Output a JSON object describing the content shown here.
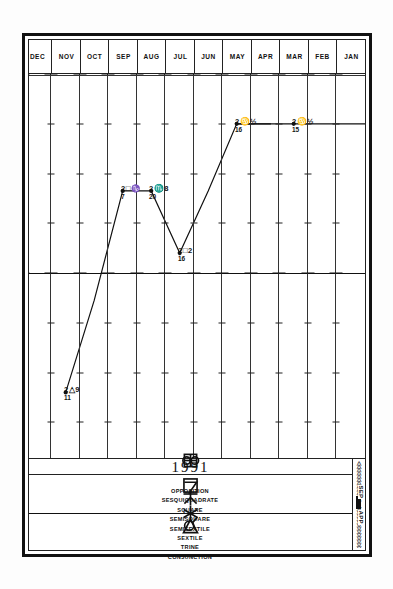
{
  "chart_data": {
    "type": "line",
    "title": "1991",
    "xlabel": "",
    "ylabel": "",
    "grid": true,
    "legend_position": "bottom",
    "orientation": "rotated-90",
    "categories": [
      "JAN",
      "FEB",
      "MAR",
      "APR",
      "MAY",
      "JUN",
      "JUL",
      "AUG",
      "SEP",
      "OCT",
      "NOV",
      "DEC"
    ],
    "axis_columns": [
      {
        "label": "OPPOSITION",
        "glyph": "opposition"
      },
      {
        "label": "SESQUIQUADRATE",
        "glyph": "sesquiquadrate"
      },
      {
        "label": "SQUARE",
        "glyph": "square"
      },
      {
        "label": "SEMISQUARE",
        "glyph": "semisquare"
      },
      {
        "label": "SEMISEXTILE",
        "glyph": "semisextile"
      },
      {
        "label": "SEXTILE",
        "glyph": "sextile"
      },
      {
        "label": "TRINE",
        "glyph": "trine"
      },
      {
        "label": "CONJUNCTION",
        "glyph": "conjunction"
      }
    ],
    "points": [
      {
        "month": "MAR",
        "label_deg": "2",
        "label_sign": "♋",
        "label_min": "½",
        "label_day": "15"
      },
      {
        "month": "MAY",
        "label_deg": "2",
        "label_sign": "♋",
        "label_min": "½",
        "label_day": "16"
      },
      {
        "month": "JUL",
        "label_deg": "2",
        "label_sign": "□",
        "label_min": "2",
        "label_day": "16"
      },
      {
        "month": "AUG",
        "label_deg": "2",
        "label_sign": "♏",
        "label_min": "8",
        "label_day": "20"
      },
      {
        "month": "SEP",
        "label_deg": "2",
        "label_sign": "□",
        "label_min": "♑",
        "label_day": "7"
      },
      {
        "month": "NOV",
        "label_deg": "2",
        "label_sign": "△",
        "label_min": "9",
        "label_day": "11"
      }
    ],
    "series": [
      {
        "name": "transit-aspect-track",
        "values": [
          1.0,
          1.0,
          1.0,
          1.0,
          1.0,
          2.35,
          3.6,
          2.35,
          2.35,
          4.55,
          6.4,
          6.4
        ]
      }
    ]
  },
  "header": {
    "year": "1991"
  },
  "scale": {
    "separating_label": "SEP",
    "applying_label": "APP"
  },
  "months": [
    {
      "label": "JAN"
    },
    {
      "label": "FEB"
    },
    {
      "label": "MAR"
    },
    {
      "label": "APR"
    },
    {
      "label": "MAY"
    },
    {
      "label": "JUN"
    },
    {
      "label": "JUL"
    },
    {
      "label": "AUG"
    },
    {
      "label": "SEP"
    },
    {
      "label": "OCT"
    },
    {
      "label": "NOV"
    },
    {
      "label": "DEC"
    }
  ],
  "aspects": [
    {
      "name": "OPPOSITION",
      "glyph": "opposition-glyph"
    },
    {
      "name": "SESQUIQUADRATE",
      "glyph": "sesquiquadrate-glyph"
    },
    {
      "name": "SQUARE",
      "glyph": "square-glyph"
    },
    {
      "name": "SEMISQUARE",
      "glyph": "semisquare-glyph"
    },
    {
      "name": "SEMISEXTILE",
      "glyph": "semisextile-glyph"
    },
    {
      "name": "SEXTILE",
      "glyph": "sextile-glyph"
    },
    {
      "name": "TRINE",
      "glyph": "trine-glyph"
    },
    {
      "name": "CONJUNCTION",
      "glyph": "conjunction-glyph"
    }
  ],
  "annotations": [
    {
      "deg": "2",
      "sign": "♋",
      "min": "½",
      "day": "15"
    },
    {
      "deg": "2",
      "sign": "♋",
      "min": "½",
      "day": "16"
    },
    {
      "deg": "2",
      "sign": "□",
      "min": "2",
      "day": "16"
    },
    {
      "deg": "2",
      "sign": "♏",
      "min": "8",
      "day": "20"
    },
    {
      "deg": "2",
      "sign": "□",
      "min": "♑",
      "day": "7"
    },
    {
      "deg": "2",
      "sign": "△",
      "min": "9",
      "day": "11"
    }
  ]
}
